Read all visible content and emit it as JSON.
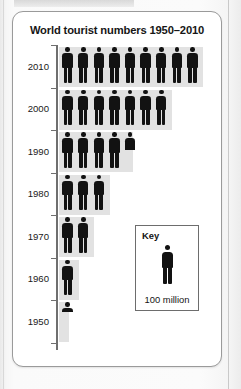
{
  "page": {
    "background_color": "#f2f2f2",
    "card_background": "#ffffff",
    "band_color": "#e2e2e2",
    "figure_color": "#121212",
    "axis_color": "#6f6f6f"
  },
  "chart": {
    "title": "World tourist numbers 1950–2010"
  },
  "key": {
    "title": "Key",
    "icon": "person-pictogram-icon",
    "caption": "100 million"
  },
  "chart_data": {
    "type": "bar",
    "subtype": "pictogram",
    "title": "World tourist numbers 1950–2010",
    "xlabel": "",
    "ylabel": "",
    "orientation": "horizontal",
    "unit": "100 million",
    "unit_label": "100 million",
    "legend": {
      "position": "inside-bottom-right",
      "title": "Key",
      "entry": "100 million"
    },
    "grid": false,
    "categories": [
      "2010",
      "2000",
      "1990",
      "1980",
      "1970",
      "1960",
      "1950"
    ],
    "icon_counts": [
      9,
      7,
      4.5,
      3,
      2,
      1,
      0.25
    ],
    "values": [
      900,
      700,
      450,
      300,
      200,
      100,
      25
    ],
    "value_unit": "millions of tourists",
    "series": [
      {
        "name": "World tourist numbers",
        "values": [
          900,
          700,
          450,
          300,
          200,
          100,
          25
        ]
      }
    ],
    "rows": [
      {
        "year": "2010",
        "full_icons": 9,
        "partial_icon": 0,
        "icon_total": 9,
        "value_millions": 900
      },
      {
        "year": "2000",
        "full_icons": 7,
        "partial_icon": 0,
        "icon_total": 7,
        "value_millions": 700
      },
      {
        "year": "1990",
        "full_icons": 4,
        "partial_icon": 0.5,
        "icon_total": 4.5,
        "value_millions": 450
      },
      {
        "year": "1980",
        "full_icons": 3,
        "partial_icon": 0,
        "icon_total": 3,
        "value_millions": 300
      },
      {
        "year": "1970",
        "full_icons": 2,
        "partial_icon": 0,
        "icon_total": 2,
        "value_millions": 200
      },
      {
        "year": "1960",
        "full_icons": 1,
        "partial_icon": 0,
        "icon_total": 1,
        "value_millions": 100
      },
      {
        "year": "1950",
        "full_icons": 0,
        "partial_icon": 0.25,
        "icon_total": 0.25,
        "value_millions": 25
      }
    ]
  }
}
